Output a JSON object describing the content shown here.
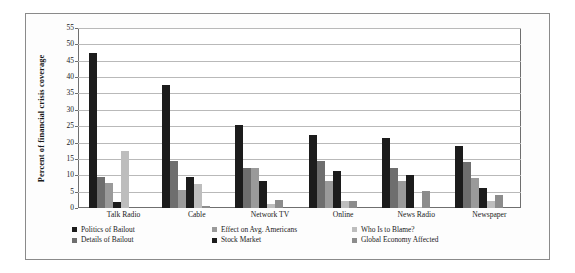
{
  "chart_data": {
    "type": "bar",
    "title": "",
    "xlabel": "",
    "ylabel": "Percent of financial crisis coverage",
    "ylim": [
      0,
      55
    ],
    "yticks": [
      0,
      5,
      10,
      15,
      20,
      25,
      30,
      35,
      40,
      45,
      50,
      55
    ],
    "grid": true,
    "legend_position": "bottom",
    "categories": [
      "Talk Radio",
      "Cable",
      "Network TV",
      "Online",
      "News Radio",
      "Newspaper"
    ],
    "series": [
      {
        "name": "Politics of Bailout",
        "color": "#1c1c1c",
        "values": [
          47.5,
          37.5,
          25.5,
          22.3,
          21.3,
          19.1
        ]
      },
      {
        "name": "Details of Bailout",
        "color": "#6e6e6e",
        "values": [
          9.5,
          14.5,
          12.3,
          14.3,
          12.1,
          14.1
        ]
      },
      {
        "name": "Effect on Avg. Americans",
        "color": "#9a9a9a",
        "values": [
          7.5,
          5.5,
          12.2,
          8.2,
          8.2,
          9.1
        ]
      },
      {
        "name": "Stock Market",
        "color": "#1c1c1c",
        "values": [
          1.7,
          9.5,
          8.3,
          11.2,
          10.1,
          6.1
        ]
      },
      {
        "name": "Who Is to Blame?",
        "color": "#bdbdbd",
        "values": [
          17.5,
          7.3,
          1.3,
          2.2,
          0.2,
          2.0
        ]
      },
      {
        "name": "Global Economy Affected",
        "color": "#8c8c8c",
        "values": [
          0.0,
          0.5,
          2.3,
          2.2,
          5.1,
          4.0
        ]
      }
    ]
  },
  "legend": {
    "columns": [
      [
        {
          "label": "Politics of Bailout",
          "color": "#1c1c1c"
        },
        {
          "label": "Details of Bailout",
          "color": "#6e6e6e"
        }
      ],
      [
        {
          "label": "Effect on Avg. Americans",
          "color": "#9a9a9a"
        },
        {
          "label": "Stock Market",
          "color": "#1c1c1c"
        }
      ],
      [
        {
          "label": "Who Is to Blame?",
          "color": "#bdbdbd"
        },
        {
          "label": "Global Economy Affected",
          "color": "#8c8c8c"
        }
      ]
    ]
  }
}
